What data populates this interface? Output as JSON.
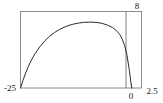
{
  "chart_data": {
    "type": "line",
    "title": "",
    "xlabel": "",
    "ylabel": "",
    "xlim": [
      0,
      2.5
    ],
    "ylim": [
      -25,
      8
    ],
    "grid": false,
    "legend": null,
    "frame": true,
    "axis_origin_line_x": 0,
    "labels": {
      "y_top": "8",
      "y_bottom": "-25",
      "x_left": "0",
      "x_right": "2.5"
    },
    "series": [
      {
        "name": "curve",
        "color": "#2b2b2b",
        "x": [
          0.0,
          0.05,
          0.1,
          0.15,
          0.2,
          0.25,
          0.3,
          0.4,
          0.5,
          0.6,
          0.7,
          0.8,
          0.9,
          1.0,
          1.1,
          1.2,
          1.3,
          1.4,
          1.5,
          1.6,
          1.7,
          1.8,
          1.9,
          2.0,
          2.05,
          2.1,
          2.15,
          2.2,
          2.25,
          2.28,
          2.3
        ],
        "y": [
          -25.0,
          -21.8,
          -18.9,
          -16.3,
          -14.0,
          -12.0,
          -10.2,
          -7.2,
          -4.7,
          -2.7,
          -1.1,
          0.2,
          1.2,
          2.0,
          2.6,
          3.0,
          3.3,
          3.4,
          3.4,
          3.2,
          2.8,
          2.1,
          1.1,
          -0.6,
          -1.9,
          -3.8,
          -6.6,
          -10.8,
          -17.5,
          -22.5,
          -25.0
        ]
      }
    ],
    "vertical_marker": {
      "x": 2.18,
      "color": "#808080",
      "label": "0"
    }
  },
  "style": {
    "frame_color": "#8c8c8c",
    "curve_color": "#2b2b2b",
    "background": "#ffffff",
    "label_color": "#1a1a1a"
  }
}
